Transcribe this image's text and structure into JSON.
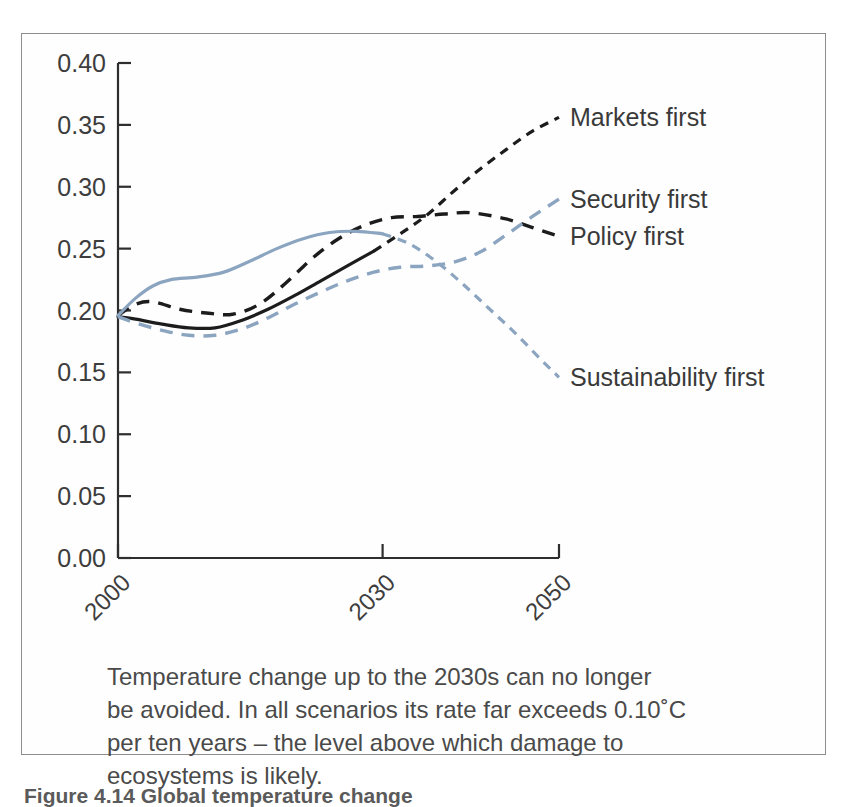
{
  "figure": {
    "footer_text": "Figure 4.14 Global temperature change",
    "caption_lines": [
      "Temperature change up to the 2030s can no longer",
      "be avoided. In all scenarios its rate far exceeds 0.10˚C",
      "per ten years – the level above which damage to",
      "ecosystems is likely."
    ]
  },
  "chart_data": {
    "type": "line",
    "title": "",
    "xlabel": "",
    "ylabel": "",
    "xlim": [
      2000,
      2050
    ],
    "ylim": [
      0.0,
      0.4
    ],
    "grid": false,
    "legend_position": "right-inline-labels",
    "x_ticks": [
      2000,
      2030,
      2050
    ],
    "x_tick_labels": [
      "2000",
      "2030",
      "2050"
    ],
    "y_ticks": [
      0.0,
      0.05,
      0.1,
      0.15,
      0.2,
      0.25,
      0.3,
      0.35,
      0.4
    ],
    "y_tick_labels": [
      "0.00",
      "0.05",
      "0.10",
      "0.15",
      "0.20",
      "0.25",
      "0.30",
      "0.35",
      "0.40"
    ],
    "series": [
      {
        "name": "Markets first",
        "label": "Markets first",
        "color": "#1c1c1c",
        "style": "solid-then-dashed",
        "x": [
          2000,
          2002,
          2005,
          2008,
          2011,
          2014,
          2017,
          2020,
          2023,
          2026,
          2029,
          2032,
          2035,
          2038,
          2041,
          2044,
          2047,
          2050
        ],
        "values": [
          0.195,
          0.193,
          0.189,
          0.186,
          0.186,
          0.192,
          0.201,
          0.212,
          0.224,
          0.236,
          0.248,
          0.262,
          0.277,
          0.296,
          0.314,
          0.33,
          0.345,
          0.356
        ]
      },
      {
        "name": "Policy first",
        "label": "Policy first",
        "color": "#1c1c1c",
        "style": "dashed",
        "x": [
          2000,
          2002,
          2004,
          2007,
          2010,
          2013,
          2016,
          2019,
          2022,
          2025,
          2028,
          2031,
          2034,
          2037,
          2040,
          2044,
          2047,
          2050
        ],
        "values": [
          0.196,
          0.205,
          0.207,
          0.201,
          0.198,
          0.197,
          0.205,
          0.222,
          0.242,
          0.258,
          0.269,
          0.275,
          0.276,
          0.278,
          0.279,
          0.274,
          0.267,
          0.26
        ]
      },
      {
        "name": "Security first",
        "label": "Security first",
        "color": "#8ba4c0",
        "style": "dashed",
        "x": [
          2000,
          2002,
          2005,
          2008,
          2011,
          2014,
          2017,
          2020,
          2023,
          2026,
          2029,
          2032,
          2035,
          2038,
          2041,
          2044,
          2047,
          2050
        ],
        "values": [
          0.195,
          0.19,
          0.184,
          0.18,
          0.18,
          0.185,
          0.194,
          0.205,
          0.215,
          0.224,
          0.231,
          0.235,
          0.236,
          0.239,
          0.247,
          0.261,
          0.276,
          0.29
        ]
      },
      {
        "name": "Sustainability first",
        "label": "Sustainability first",
        "color": "#8ba4c0",
        "style": "solid-then-dashed",
        "x": [
          2000,
          2002,
          2004,
          2006,
          2009,
          2012,
          2015,
          2018,
          2021,
          2024,
          2027,
          2030,
          2033,
          2036,
          2039,
          2042,
          2045,
          2048,
          2050
        ],
        "values": [
          0.196,
          0.21,
          0.22,
          0.225,
          0.227,
          0.231,
          0.24,
          0.25,
          0.258,
          0.263,
          0.264,
          0.262,
          0.254,
          0.24,
          0.222,
          0.202,
          0.182,
          0.16,
          0.146
        ]
      }
    ],
    "annotations": []
  }
}
